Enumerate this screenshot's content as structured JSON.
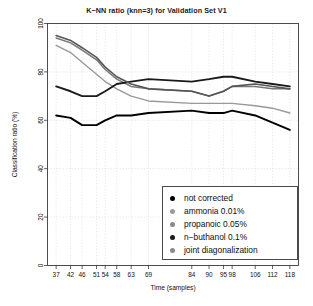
{
  "chart_data": {
    "type": "line",
    "title": "K−NN ratio (knn=3) for Validation Set V1",
    "xlabel": "Time (samples)",
    "ylabel": "Classification ratio (%)",
    "xlim": [
      34,
      121
    ],
    "ylim": [
      0,
      100
    ],
    "grid": true,
    "grid_color": "#d8d8d8",
    "legend_position": "bottom-right",
    "x_ticks": [
      37,
      42,
      46,
      51,
      54,
      58,
      63,
      69,
      84,
      90,
      95,
      98,
      106,
      112,
      118
    ],
    "x_tick_labels": [
      "37",
      "42",
      "46",
      "51",
      "54",
      "58",
      "63",
      "69",
      "84",
      "90",
      "95",
      "98",
      "106",
      "112",
      "118"
    ],
    "y_ticks": [
      0,
      20,
      40,
      60,
      80,
      100
    ],
    "y_tick_labels": [
      "0",
      "20",
      "40",
      "60",
      "80",
      "100"
    ],
    "x": [
      37,
      42,
      46,
      51,
      54,
      58,
      63,
      69,
      84,
      90,
      95,
      98,
      106,
      112,
      118
    ],
    "series": [
      {
        "name": "not corrected",
        "color": "#000000",
        "width": 1.9,
        "values": [
          62,
          61,
          58,
          58,
          60,
          62,
          62,
          63,
          64,
          63,
          63,
          64,
          62,
          59,
          56
        ]
      },
      {
        "name": "ammonia 0.01%",
        "color": "#999999",
        "width": 1.4,
        "values": [
          91,
          88,
          84,
          79,
          76,
          73,
          70,
          68,
          67,
          67,
          67,
          67,
          66,
          65,
          63
        ]
      },
      {
        "name": "propanoic 0.05%",
        "color": "#777777",
        "width": 1.5,
        "values": [
          94,
          92,
          89,
          85,
          81,
          77,
          74,
          73,
          72,
          70,
          72,
          74,
          74,
          73,
          73
        ]
      },
      {
        "name": "n−buthanol 0.1%",
        "color": "#1a1a1a",
        "width": 1.9,
        "values": [
          74,
          72,
          70,
          70,
          72,
          75,
          76,
          77,
          76,
          77,
          78,
          78,
          76,
          75,
          74
        ]
      },
      {
        "name": "joint diagonalization",
        "color": "#555555",
        "width": 1.6,
        "values": [
          95,
          93,
          90,
          86,
          82,
          78,
          75,
          73,
          72,
          70,
          72,
          74,
          75,
          74,
          73
        ]
      }
    ]
  },
  "legend": {
    "items": [
      {
        "label": "not corrected",
        "color": "#000000"
      },
      {
        "label": "ammonia 0.01%",
        "color": "#9a9a9a"
      },
      {
        "label": "propanoic 0.05%",
        "color": "#8a8a8a"
      },
      {
        "label": "n−buthanol 0.1%",
        "color": "#1a1a1a"
      },
      {
        "label": "joint diagonalization",
        "color": "#8a8a8a"
      }
    ]
  }
}
